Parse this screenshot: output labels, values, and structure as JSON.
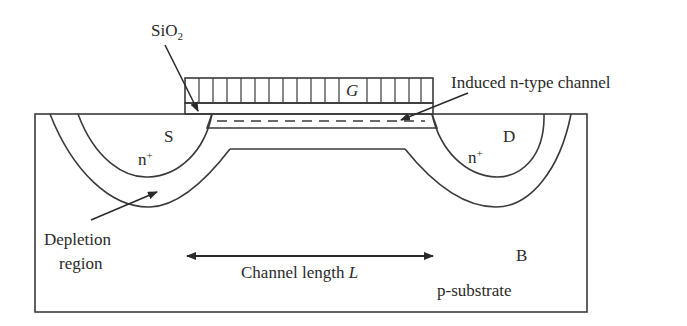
{
  "figure": {
    "labels": {
      "oxide": "SiO",
      "oxide_sub": "2",
      "gate": "G",
      "induced_channel": "Induced n-type channel",
      "source": "S",
      "drain": "D",
      "source_doping": "n",
      "drain_doping": "n",
      "doping_sup": "+",
      "depletion_line1": "Depletion",
      "depletion_line2": "region",
      "channel_length": "Channel length ",
      "channel_length_symbol": "L",
      "body": "B",
      "substrate": "p-substrate"
    },
    "colors": {
      "line": "#3a3a3a",
      "background": "#ffffff"
    }
  }
}
